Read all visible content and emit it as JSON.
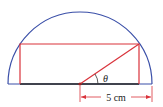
{
  "diagram": {
    "type": "semicircle-inscribed-rectangle",
    "labels": {
      "angle": "θ",
      "dimension": "5 cm"
    },
    "colors": {
      "semicircle": "#3a4fa8",
      "rectangle": "#d9333b",
      "base": "#222222",
      "dimension": "#d9333b",
      "text": "#222222"
    },
    "geometry": {
      "radius_label": "5 cm",
      "angle_label": "θ"
    }
  }
}
